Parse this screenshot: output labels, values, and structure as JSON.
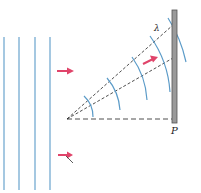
{
  "diagram": {
    "labels": {
      "wavelength": "λ",
      "screen": "P"
    },
    "colors": {
      "wavefront": "#5b9bc8",
      "arrow": "#e0446a",
      "dashed": "#222222",
      "screen_fill": "#9a9a9a",
      "screen_edge": "#555555"
    },
    "plane_wavefronts": {
      "count": 4,
      "x_positions": [
        4,
        19,
        35,
        50
      ]
    },
    "screen": {
      "x": 172,
      "y_top": 10,
      "y_bottom": 123
    },
    "source_point": {
      "x": 67,
      "y": 119
    }
  }
}
